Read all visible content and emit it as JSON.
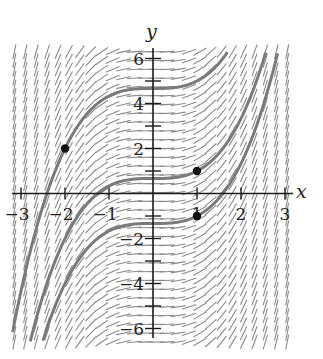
{
  "chart_data": {
    "type": "slope_field",
    "title": "",
    "differential_equation": "dy/dx = x^2",
    "xlabel": "x",
    "ylabel": "y",
    "xlim": [
      -3,
      3
    ],
    "ylim": [
      -6,
      6
    ],
    "x_ticks": [
      -3,
      -2,
      -1,
      1,
      2,
      3
    ],
    "x_tick_labels": [
      "−3",
      "−2",
      "−1",
      "1",
      "2",
      "3"
    ],
    "y_ticks": [
      -6,
      -5,
      -4,
      -3,
      -2,
      -1,
      1,
      2,
      3,
      4,
      5,
      6
    ],
    "y_labeled_ticks": [
      -6,
      -4,
      -2,
      2,
      4,
      6
    ],
    "y_tick_labels": [
      "−6",
      "−4",
      "−2",
      "2",
      "4",
      "6"
    ],
    "grid": false,
    "field": {
      "x_range": [
        -3.15,
        3.05
      ],
      "y_range": [
        -6.6,
        6.3
      ],
      "nx": 26,
      "ny": 34,
      "segment_length": 0.12
    },
    "solution_curves": [
      {
        "name": "through (-2, 2)",
        "C": 4.667
      },
      {
        "name": "through (1, 1)",
        "C": 0.667
      },
      {
        "name": "through (1, -1)",
        "C": -1.333
      }
    ],
    "points": [
      {
        "x": -2,
        "y": 2
      },
      {
        "x": 1,
        "y": 1
      },
      {
        "x": 1,
        "y": -1
      }
    ],
    "colors": {
      "axis": "#1a1a1a",
      "field": "#8a8a8a",
      "curve": "#7a7a7a",
      "point": "#111111"
    }
  }
}
